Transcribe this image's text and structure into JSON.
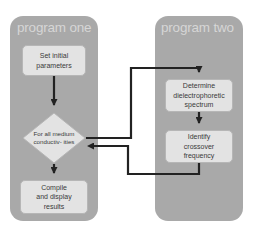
{
  "diagram": {
    "type": "flowchart",
    "colors": {
      "panel_fill": "#a9a9a9",
      "panel_title_text": "#d6d6d6",
      "node_fill": "#e3e3e3",
      "node_border": "#b6b6b6",
      "node_text": "#3a3a3a",
      "connector": "#222222",
      "background": "#ffffff"
    },
    "panels": [
      {
        "id": "program-one",
        "title": "program one"
      },
      {
        "id": "program-two",
        "title": "program two"
      }
    ],
    "nodes": {
      "set_initial": {
        "shape": "process",
        "panel": "program-one",
        "lines": [
          "Set initial",
          "parameters"
        ]
      },
      "decision": {
        "shape": "decision",
        "panel": "program-one",
        "lines": [
          "For",
          "all medium",
          "conductiv-",
          "ities"
        ]
      },
      "compile": {
        "shape": "process",
        "panel": "program-one",
        "lines": [
          "Compile",
          "and display",
          "results"
        ]
      },
      "determine": {
        "shape": "process",
        "panel": "program-two",
        "lines": [
          "Determine",
          "dielectrophoretic",
          "spectrum"
        ]
      },
      "identify": {
        "shape": "process",
        "panel": "program-two",
        "lines": [
          "Identify",
          "crossover",
          "frequency"
        ]
      }
    },
    "connectors": [
      {
        "id": "set-initial-to-decision",
        "from": "set_initial",
        "to": "decision",
        "routing": "vertical",
        "arrow": "down"
      },
      {
        "id": "decision-to-determine",
        "from": "decision",
        "to": "determine",
        "routing": "right-up-right",
        "arrow": "down"
      },
      {
        "id": "determine-to-identify",
        "from": "determine",
        "to": "identify",
        "routing": "vertical",
        "arrow": "down"
      },
      {
        "id": "identify-to-decision",
        "from": "identify",
        "to": "decision",
        "routing": "down-left-up-left",
        "arrow": "left"
      },
      {
        "id": "decision-to-compile",
        "from": "decision",
        "to": "compile",
        "routing": "vertical",
        "arrow": "down"
      }
    ]
  }
}
